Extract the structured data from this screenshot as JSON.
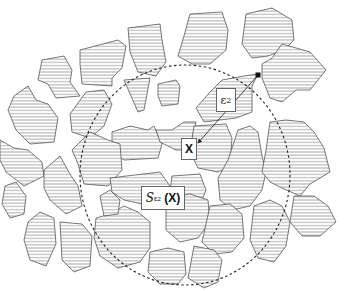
{
  "diagram": {
    "colors": {
      "stroke": "#555555",
      "hatch": "#666666",
      "background": "#ffffff",
      "circle": "#222222"
    },
    "labels": {
      "point": "X",
      "radius_symbol": "ε",
      "radius_sub": "2",
      "sphere_symbol": "S",
      "sphere_sub_symbol": "ε",
      "sphere_sub_index": "2",
      "sphere_arg": "(X)"
    },
    "circle": {
      "cx": 185,
      "cy": 175,
      "rx": 105,
      "ry": 110
    },
    "radius_point": {
      "x": 258,
      "y": 75
    },
    "center_point": {
      "x": 198,
      "y": 143
    },
    "grains": [
      {
        "id": 1,
        "points": "80,50 118,40 126,46 122,68 112,78 112,86 82,84 80,64"
      },
      {
        "id": 2,
        "points": "128,28 160,24 162,40 166,62 156,76 138,72 130,52"
      },
      {
        "id": 3,
        "points": "190,14 222,12 228,30 226,50 210,64 192,64 178,56 184,36"
      },
      {
        "id": 4,
        "points": "246,14 272,8 292,20 294,40 284,50 268,56 252,58 242,44"
      },
      {
        "id": 5,
        "points": "42,60 64,56 72,70 70,82 80,96 56,98 48,84 38,80"
      },
      {
        "id": 6,
        "points": "124,80 150,78 144,110 138,112"
      },
      {
        "id": 7,
        "points": "158,84 176,80 180,86 178,104 162,106 158,96"
      },
      {
        "id": 8,
        "points": "14,96 28,86 36,100 48,104 58,118 54,142 30,144 16,130 8,110"
      },
      {
        "id": 9,
        "points": "70,114 86,92 104,90 112,104 104,126 90,138 72,132"
      },
      {
        "id": 10,
        "points": "112,132 130,126 148,130 154,126 162,144 158,158 124,160 112,152"
      },
      {
        "id": 11,
        "points": "156,130 172,130 184,122 196,122 190,150 176,150 160,142"
      },
      {
        "id": 12,
        "points": "222,80 244,76 258,74 252,86 252,112 236,118 204,122 196,108 210,92"
      },
      {
        "id": 13,
        "points": "262,64 272,58 282,44 310,52 326,70 310,90 296,90 282,102 270,98 262,78"
      },
      {
        "id": 14,
        "points": "194,126 226,124 232,138 230,166 218,172 198,168 190,152"
      },
      {
        "id": 15,
        "points": "72,150 90,132 108,140 120,144 122,170 108,186 84,184 78,164"
      },
      {
        "id": 16,
        "points": "0,140 14,148 28,150 42,162 44,176 24,186 6,172 0,160"
      },
      {
        "id": 17,
        "points": "44,170 60,156 70,174 78,186 82,206 66,214 50,200 44,188"
      },
      {
        "id": 18,
        "points": "110,178 160,172 170,186 168,198 142,204 124,200 112,192"
      },
      {
        "id": 19,
        "points": "238,130 250,126 258,132 262,156 266,172 262,190 250,206 232,210 220,200 218,178 228,160"
      },
      {
        "id": 20,
        "points": "270,122 286,120 304,122 314,132 324,148 330,172 310,184 300,196 282,188 270,182 262,172 266,150"
      },
      {
        "id": 21,
        "points": "172,176 200,174 206,190 198,210 178,214 168,206"
      },
      {
        "id": 22,
        "points": "28,222 40,212 54,218 56,244 46,266 30,260 24,240"
      },
      {
        "id": 23,
        "points": "60,222 82,224 92,236 90,266 74,272 62,260"
      },
      {
        "id": 24,
        "points": "96,218 110,214 124,206 138,212 150,222 150,248 140,262 118,268 100,256 94,238"
      },
      {
        "id": 25,
        "points": "166,198 190,194 208,200 210,222 198,238 180,242 166,230"
      },
      {
        "id": 26,
        "points": "210,206 230,204 242,214 244,238 232,252 214,254 202,242"
      },
      {
        "id": 27,
        "points": "254,206 270,200 282,206 290,222 286,246 274,262 258,258 250,240"
      },
      {
        "id": 28,
        "points": "294,196 314,196 328,206 336,222 320,236 302,236 290,222"
      },
      {
        "id": 29,
        "points": "150,252 168,248 184,252 186,274 178,284 160,284 148,272"
      },
      {
        "id": 30,
        "points": "194,246 214,250 222,260 218,282 204,288 188,278"
      },
      {
        "id": 31,
        "points": "5,186 16,182 26,196 24,214 10,218 2,204"
      },
      {
        "id": 32,
        "points": "100,196 110,190 120,200 118,214 104,216"
      }
    ]
  }
}
